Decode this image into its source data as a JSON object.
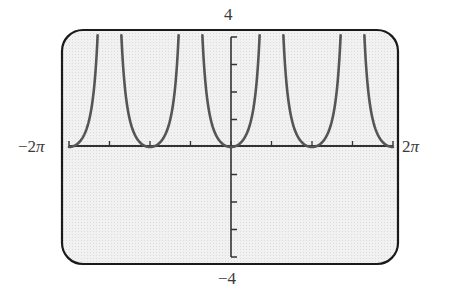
{
  "chart_data": {
    "type": "line",
    "title": "",
    "function": "y = tan^2(x)",
    "xlabel": "",
    "ylabel": "",
    "xlim": [
      -6.2832,
      6.2832
    ],
    "ylim": [
      -4,
      4
    ],
    "x_tick_step": 1.5708,
    "y_tick_step": 1,
    "grid": false,
    "legend": null,
    "x_axis_labels": {
      "min": "−2π",
      "max": "2π"
    },
    "y_axis_labels": {
      "max": "4",
      "min": "−4"
    },
    "vertical_asymptotes": [
      -4.7124,
      -1.5708,
      1.5708,
      4.7124
    ],
    "minima": [
      {
        "x": -6.2832,
        "y": 0
      },
      {
        "x": -3.1416,
        "y": 0
      },
      {
        "x": 0,
        "y": 0
      },
      {
        "x": 3.1416,
        "y": 0
      },
      {
        "x": 6.2832,
        "y": 0
      }
    ],
    "series": [
      {
        "name": "tan^2(x)",
        "color": "#555555",
        "sample_points": [
          {
            "x": -6.2832,
            "y": 0
          },
          {
            "x": -5.5,
            "y": 1.0
          },
          {
            "x": -5.0,
            "y": 3.3
          },
          {
            "x": -4.3,
            "y": 4.0
          },
          {
            "x": -3.8,
            "y": 0.6
          },
          {
            "x": -3.1416,
            "y": 0
          },
          {
            "x": -2.5,
            "y": 0.56
          },
          {
            "x": -2.0,
            "y": 4.0
          },
          {
            "x": -1.0,
            "y": 2.43
          },
          {
            "x": -0.5,
            "y": 0.3
          },
          {
            "x": 0,
            "y": 0
          },
          {
            "x": 0.5,
            "y": 0.3
          },
          {
            "x": 1.0,
            "y": 2.43
          },
          {
            "x": 2.0,
            "y": 4.0
          },
          {
            "x": 2.5,
            "y": 0.56
          },
          {
            "x": 3.1416,
            "y": 0
          },
          {
            "x": 3.8,
            "y": 0.6
          },
          {
            "x": 4.3,
            "y": 4.0
          },
          {
            "x": 5.0,
            "y": 3.3
          },
          {
            "x": 5.5,
            "y": 1.0
          },
          {
            "x": 6.2832,
            "y": 0
          }
        ]
      }
    ]
  },
  "labels": {
    "y_max": "4",
    "y_min": "−4",
    "x_min_prefix": "−2",
    "x_max_prefix": "2",
    "pi_symbol": "π"
  },
  "colors": {
    "screen_background": "#efefef",
    "frame": "#1a1a1a",
    "axis": "#333333",
    "curve": "#555555"
  }
}
